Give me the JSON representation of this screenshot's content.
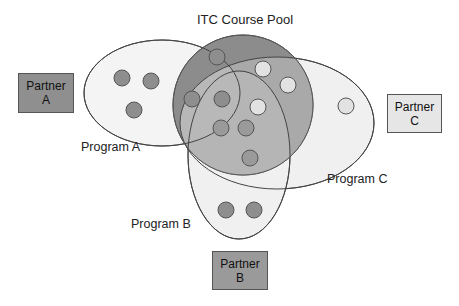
{
  "title": "ITC Course Pool",
  "colors": {
    "pool_fill": "#8c8c8c",
    "program_a_fill": "#f4f4f4",
    "program_b_fill": "#f0f0f0",
    "program_c_fill": "#f0f0f0",
    "overlap_fill": "#b0b0b0",
    "dot_dark": "#8e8e8e",
    "dot_light": "#e2e2e2",
    "partner_a_fill": "#8f8f8f",
    "partner_b_fill": "#9a9a9a",
    "partner_c_fill": "#e6e6e6",
    "stroke": "#444444"
  },
  "partners": [
    {
      "id": "a",
      "line1": "Partner",
      "line2": "A"
    },
    {
      "id": "b",
      "line1": "Partner",
      "line2": "B"
    },
    {
      "id": "c",
      "line1": "Partner",
      "line2": "C"
    }
  ],
  "programs": [
    {
      "id": "a",
      "label": "Program A"
    },
    {
      "id": "b",
      "label": "Program B"
    },
    {
      "id": "c",
      "label": "Program C"
    }
  ],
  "courses": {
    "program_a_only": 3,
    "program_b_only": 2,
    "program_c_only": 1,
    "pool_dark": 6,
    "pool_light": 3
  }
}
